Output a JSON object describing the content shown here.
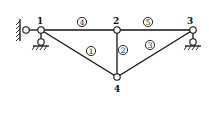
{
  "diagram": {
    "type": "truss",
    "nodes": [
      {
        "id": "1",
        "label": "1",
        "x": 41,
        "y": 30
      },
      {
        "id": "2",
        "label": "2",
        "x": 117,
        "y": 30
      },
      {
        "id": "3",
        "label": "3",
        "x": 193,
        "y": 30
      },
      {
        "id": "4",
        "label": "4",
        "x": 117,
        "y": 77
      }
    ],
    "elements": [
      {
        "id": "1",
        "label": "1",
        "from": "1",
        "to": "4"
      },
      {
        "id": "2",
        "label": "2",
        "from": "2",
        "to": "4"
      },
      {
        "id": "3",
        "label": "3",
        "from": "3",
        "to": "4"
      },
      {
        "id": "4",
        "label": "4",
        "from": "1",
        "to": "2"
      },
      {
        "id": "5",
        "label": "5",
        "from": "2",
        "to": "3"
      }
    ],
    "supports": [
      {
        "node": "1",
        "type": "horizontal-link-to-wall",
        "side": "left"
      },
      {
        "node": "1",
        "type": "vertical-link-to-ground"
      },
      {
        "node": "3",
        "type": "vertical-link-to-ground"
      }
    ]
  }
}
